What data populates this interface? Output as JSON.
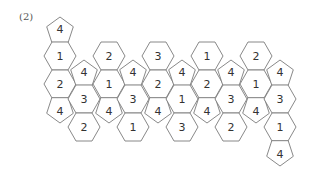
{
  "label": "(2)",
  "colors": {
    "stroke": "#7a7a7a",
    "text": "#333333",
    "background": "#ffffff"
  },
  "net": {
    "description": "Net of hexagons and pentagons each labeled with a number",
    "shapes": [
      {
        "type": "pentagon",
        "value": "4",
        "x": 60,
        "y": 29
      },
      {
        "type": "hexagon",
        "value": "1",
        "x": 60,
        "y": 56
      },
      {
        "type": "hexagon",
        "value": "2",
        "x": 60,
        "y": 84
      },
      {
        "type": "pentagon",
        "value": "4",
        "x": 60,
        "y": 111
      },
      {
        "type": "pentagon",
        "value": "4",
        "x": 84,
        "y": 72
      },
      {
        "type": "hexagon",
        "value": "3",
        "x": 84,
        "y": 99
      },
      {
        "type": "hexagon",
        "value": "2",
        "x": 84,
        "y": 127
      },
      {
        "type": "hexagon",
        "value": "2",
        "x": 109,
        "y": 56
      },
      {
        "type": "hexagon",
        "value": "1",
        "x": 109,
        "y": 84
      },
      {
        "type": "pentagon",
        "value": "4",
        "x": 109,
        "y": 111
      },
      {
        "type": "pentagon",
        "value": "4",
        "x": 133,
        "y": 72
      },
      {
        "type": "hexagon",
        "value": "3",
        "x": 133,
        "y": 99
      },
      {
        "type": "hexagon",
        "value": "1",
        "x": 133,
        "y": 127
      },
      {
        "type": "hexagon",
        "value": "3",
        "x": 158,
        "y": 56
      },
      {
        "type": "hexagon",
        "value": "2",
        "x": 158,
        "y": 84
      },
      {
        "type": "pentagon",
        "value": "4",
        "x": 158,
        "y": 111
      },
      {
        "type": "pentagon",
        "value": "4",
        "x": 182,
        "y": 72
      },
      {
        "type": "hexagon",
        "value": "1",
        "x": 182,
        "y": 99
      },
      {
        "type": "hexagon",
        "value": "3",
        "x": 182,
        "y": 127
      },
      {
        "type": "hexagon",
        "value": "1",
        "x": 207,
        "y": 56
      },
      {
        "type": "hexagon",
        "value": "2",
        "x": 207,
        "y": 84
      },
      {
        "type": "pentagon",
        "value": "4",
        "x": 207,
        "y": 111
      },
      {
        "type": "pentagon",
        "value": "4",
        "x": 231,
        "y": 72
      },
      {
        "type": "hexagon",
        "value": "3",
        "x": 231,
        "y": 99
      },
      {
        "type": "hexagon",
        "value": "2",
        "x": 231,
        "y": 127
      },
      {
        "type": "hexagon",
        "value": "2",
        "x": 256,
        "y": 56
      },
      {
        "type": "hexagon",
        "value": "1",
        "x": 256,
        "y": 84
      },
      {
        "type": "pentagon",
        "value": "4",
        "x": 256,
        "y": 111
      },
      {
        "type": "pentagon",
        "value": "4",
        "x": 280,
        "y": 72
      },
      {
        "type": "hexagon",
        "value": "3",
        "x": 280,
        "y": 99
      },
      {
        "type": "hexagon",
        "value": "1",
        "x": 280,
        "y": 127
      },
      {
        "type": "pentagon",
        "value": "4",
        "x": 280,
        "y": 154
      }
    ]
  }
}
